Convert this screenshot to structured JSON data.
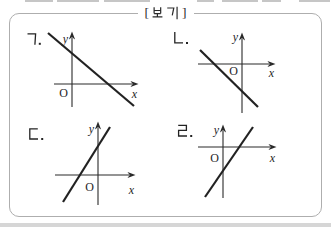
{
  "colors": {
    "figure_line": "#222222",
    "axis_line": "#2a2a2a",
    "box_border": "#aeaeae",
    "text": "#2b2b2b",
    "background": "#ffffff",
    "bottom_band": "#d6d6d6"
  },
  "header": {
    "title_text": "[ 보기 ]",
    "bracket_open": "[",
    "bracket_close": "]",
    "title_word": "보기"
  },
  "graphs": [
    {
      "label": "ㄱ.",
      "x_axis_label": "x",
      "y_axis_label": "y",
      "origin_label": "O",
      "depicts": {
        "type": "line",
        "slope": "negative",
        "x_intercept": "positive",
        "y_intercept": "positive"
      },
      "geom": {
        "y_axis": "M54 10 V79",
        "y_arrow": "M54 3.5 L50.9 11.5 L54 9.3 L57.1 11.5 Z",
        "x_axis": "M36 56 H114",
        "x_arrow": "M120.5 56 L112.5 52.9 L114.7 56 L112.5 59.1 Z",
        "line": "M30 5 L116 78"
      }
    },
    {
      "label": "ㄴ.",
      "x_axis_label": "x",
      "y_axis_label": "y",
      "origin_label": "O",
      "depicts": {
        "type": "line",
        "slope": "negative",
        "x_intercept": "negative",
        "y_intercept": "negative"
      },
      "geom": {
        "y_axis": "M70 11 V85",
        "y_arrow": "M70 4.5 L66.9 12.5 L70 10.3 L73.1 12.5 Z",
        "x_axis": "M26 36 H97",
        "x_arrow": "M103.5 36 L95.5 32.9 L97.7 36 L95.5 39.1 Z",
        "line": "M28 22 L86 79"
      }
    },
    {
      "label": "ㄷ.",
      "x_axis_label": "x",
      "y_axis_label": "y",
      "origin_label": "O",
      "depicts": {
        "type": "line",
        "slope": "positive",
        "x_intercept": "negative",
        "y_intercept": "positive"
      },
      "geom": {
        "y_axis": "M80 10 V87",
        "y_arrow": "M80 3.5 L76.9 11.5 L80 9.3 L83.1 11.5 Z",
        "x_axis": "M37 57 H111",
        "x_arrow": "M117.5 57 L109.5 53.9 L111.7 57 L109.5 60.1 Z",
        "line": "M45 84 L92 9"
      }
    },
    {
      "label": "ㄹ.",
      "x_axis_label": "x",
      "y_axis_label": "y",
      "origin_label": "O",
      "depicts": {
        "type": "line",
        "slope": "positive",
        "x_intercept": "positive",
        "y_intercept": "negative"
      },
      "geom": {
        "y_axis": "M51 13 V80",
        "y_arrow": "M51 6.5 L47.9 14.5 L51 12.3 L54.1 14.5 Z",
        "x_axis": "M26 29 H98",
        "x_arrow": "M104.5 29 L96.5 25.9 L98.7 29 L96.5 32.1 Z",
        "line": "M33 79 L81 9"
      }
    }
  ]
}
